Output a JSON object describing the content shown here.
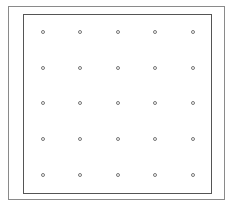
{
  "grid": {
    "rows": 5,
    "cols": 5,
    "xs": [
      43,
      80,
      118,
      155,
      193
    ],
    "ys": [
      32,
      68,
      103,
      139,
      175
    ],
    "dot_color": "#777777"
  }
}
